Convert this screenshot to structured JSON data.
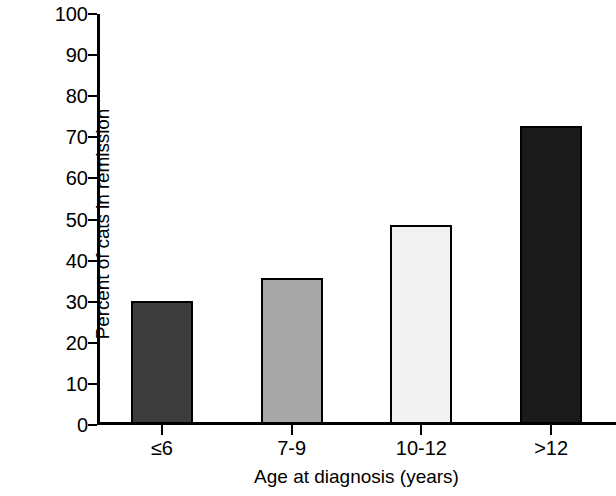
{
  "chart_data": {
    "type": "bar",
    "title": "",
    "subtitle": "",
    "xlabel": "Age at diagnosis (years)",
    "ylabel": "Percent of cats in remission",
    "categories": [
      "≤6",
      "7-9",
      "10-12",
      ">12"
    ],
    "values": [
      30,
      35.5,
      48.5,
      72.5
    ],
    "ylim": [
      0,
      100
    ],
    "yticks": [
      0,
      10,
      20,
      30,
      40,
      50,
      60,
      70,
      80,
      90,
      100
    ],
    "ytick_labels": [
      "0",
      "10",
      "20",
      "30",
      "40",
      "50",
      "60",
      "70",
      "80",
      "90",
      "100"
    ],
    "grid": false,
    "legend": false,
    "legend_position": "none",
    "bar_colors": [
      "#3d3d3d",
      "#a8a8a8",
      "#f2f2f2",
      "#1a1a1a"
    ],
    "bar_edge_color": "#000000",
    "axis_color": "#000000",
    "background": "#ffffff",
    "bars": [
      {
        "category": "≤6",
        "value": 30,
        "color": "#3d3d3d"
      },
      {
        "category": "7-9",
        "value": 35.5,
        "color": "#a8a8a8"
      },
      {
        "category": "10-12",
        "value": 48.5,
        "color": "#f2f2f2"
      },
      {
        "category": ">12",
        "value": 72.5,
        "color": "#1a1a1a"
      }
    ]
  }
}
